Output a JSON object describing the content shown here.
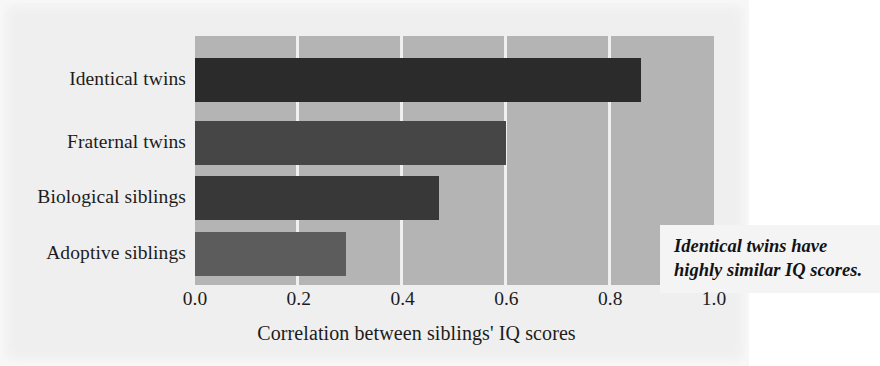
{
  "chart_data": {
    "type": "bar",
    "orientation": "horizontal",
    "title": "",
    "subtitle": "",
    "categories": [
      "Identical twins",
      "Fraternal twins",
      "Biological siblings",
      "Adoptive siblings"
    ],
    "values": [
      0.86,
      0.6,
      0.47,
      0.29
    ],
    "series": [
      {
        "name": "Correlation between siblings' IQ scores",
        "values": [
          0.86,
          0.6,
          0.47,
          0.29
        ]
      }
    ],
    "xlabel": "Correlation between siblings' IQ scores",
    "ylabel": "",
    "xlim": [
      0.0,
      1.0
    ],
    "xticks": [
      "0.0",
      "0.2",
      "0.4",
      "0.6",
      "0.8",
      "1.0"
    ],
    "xtick_values": [
      0.0,
      0.2,
      0.4,
      0.6,
      0.8,
      1.0
    ],
    "grid": "vertical-gridlines-white",
    "legend": "none",
    "bar_colors": [
      "#2b2b2b",
      "#464646",
      "#383838",
      "#5c5c5c"
    ],
    "plot_background": "#b4b4b4",
    "figure_background": "#efefef",
    "gridline_color": "#f0f0f0",
    "text_color": "#1c1c1c",
    "annotations": [
      {
        "lines": [
          "Identical twins have",
          "highly similar IQ scores."
        ],
        "style": "bold-italic",
        "background": "#f4f4f4"
      }
    ]
  },
  "axis": {
    "x_title": "Correlation between siblings' IQ scores",
    "ticks": [
      {
        "label": "0.0",
        "value": 0.0
      },
      {
        "label": "0.2",
        "value": 0.2
      },
      {
        "label": "0.4",
        "value": 0.4
      },
      {
        "label": "0.6",
        "value": 0.6
      },
      {
        "label": "0.8",
        "value": 0.8
      },
      {
        "label": "1.0",
        "value": 1.0
      }
    ]
  },
  "bars": [
    {
      "label": "Identical twins",
      "value": 0.86,
      "color": "#2b2b2b"
    },
    {
      "label": "Fraternal twins",
      "value": 0.6,
      "color": "#464646"
    },
    {
      "label": "Biological siblings",
      "value": 0.47,
      "color": "#383838"
    },
    {
      "label": "Adoptive siblings",
      "value": 0.29,
      "color": "#5c5c5c"
    }
  ],
  "annotation": {
    "line1": "Identical twins have",
    "line2": "highly similar IQ scores."
  }
}
